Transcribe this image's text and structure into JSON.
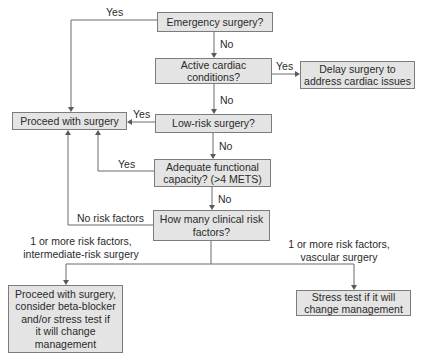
{
  "nodes": {
    "emergency": "Emergency surgery?",
    "active_cardiac": "Active cardiac\nconditions?",
    "delay": "Delay surgery to\naddress cardiac issues",
    "proceed": "Proceed with surgery",
    "low_risk": "Low-risk surgery?",
    "functional": "Adequate functional\ncapacity? (>4 METS)",
    "risk_factors": "How many clinical risk\nfactors?",
    "proceed_beta": "Proceed with surgery,\nconsider beta-blocker\nand/or stress test if\nit will change\nmanagement",
    "stress_test": "Stress test if it will\nchange management"
  },
  "edges": {
    "emergency_yes": "Yes",
    "emergency_no": "No",
    "cardiac_yes": "Yes",
    "cardiac_no": "No",
    "lowrisk_yes": "Yes",
    "lowrisk_no": "No",
    "functional_yes": "Yes",
    "functional_no": "No",
    "no_risk": "No risk factors",
    "intermediate": "1 or more risk factors,\nintermediate-risk surgery",
    "vascular": "1 or more risk factors,\nvascular surgery"
  },
  "style": {
    "box_fill": "#e4e4e4",
    "box_border": "#7c7c7c",
    "line_color": "#6a6a6a",
    "text_color": "#2a2a2a"
  }
}
